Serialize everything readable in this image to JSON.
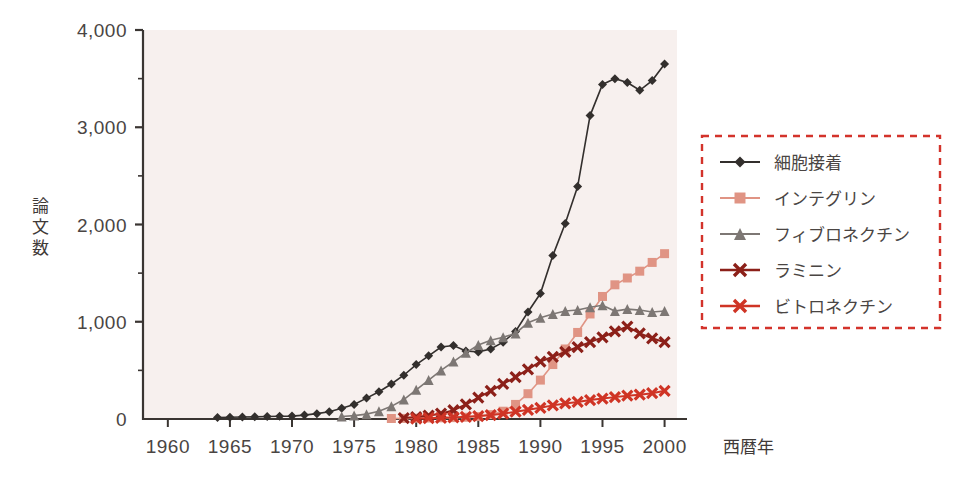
{
  "figure": {
    "background_color": "#ffffff",
    "plot_background_color": "#f7f0ee",
    "axis_color": "#3a3532"
  },
  "chart_data": {
    "type": "line",
    "title": "",
    "subtitle": "",
    "xlabel": "西暦年",
    "ylabel": "論文数",
    "xlim": [
      1958,
      2001
    ],
    "ylim": [
      0,
      4000
    ],
    "grid": false,
    "legend_position": "right",
    "legend_border_color": "#d3332b",
    "legend_border_style": "dashed",
    "x_ticks": [
      1960,
      1965,
      1970,
      1975,
      1980,
      1985,
      1990,
      1995,
      2000
    ],
    "x_tick_labels": [
      "1960",
      "1965",
      "1970",
      "1975",
      "1980",
      "1985",
      "1990",
      "1995",
      "2000"
    ],
    "y_ticks": [
      0,
      1000,
      2000,
      3000,
      4000
    ],
    "y_tick_labels": [
      "0",
      "1,000",
      "2,000",
      "3,000",
      "4,000"
    ],
    "y_minor_ticks": [
      500,
      1500,
      2500,
      3500
    ],
    "series": [
      {
        "name": "細胞接着",
        "color": "#332f2d",
        "marker": "diamond",
        "marker_size": 9,
        "line_width": 1.6,
        "x": [
          1964,
          1965,
          1966,
          1967,
          1968,
          1969,
          1970,
          1971,
          1972,
          1973,
          1974,
          1975,
          1976,
          1977,
          1978,
          1979,
          1980,
          1981,
          1982,
          1983,
          1984,
          1985,
          1986,
          1987,
          1988,
          1989,
          1990,
          1991,
          1992,
          1993,
          1994,
          1995,
          1996,
          1997,
          1998,
          1999,
          2000
        ],
        "values": [
          15,
          18,
          20,
          22,
          25,
          28,
          30,
          40,
          55,
          75,
          110,
          150,
          215,
          280,
          360,
          450,
          560,
          650,
          740,
          755,
          700,
          690,
          720,
          790,
          900,
          1100,
          1290,
          1680,
          2010,
          2390,
          3120,
          3440,
          3500,
          3460,
          3380,
          3480,
          3650
        ]
      },
      {
        "name": "インテグリン",
        "color": "#e09484",
        "marker": "square",
        "marker_size": 9,
        "line_width": 1.6,
        "x": [
          1978,
          1979,
          1980,
          1981,
          1982,
          1983,
          1984,
          1985,
          1986,
          1987,
          1988,
          1989,
          1990,
          1991,
          1992,
          1993,
          1994,
          1995,
          1996,
          1997,
          1998,
          1999,
          2000
        ],
        "values": [
          5,
          6,
          8,
          10,
          12,
          14,
          18,
          25,
          45,
          80,
          150,
          260,
          400,
          560,
          720,
          890,
          1080,
          1260,
          1380,
          1450,
          1520,
          1610,
          1700
        ]
      },
      {
        "name": "フィブロネクチン",
        "color": "#7d7774",
        "marker": "triangle",
        "marker_size": 10,
        "line_width": 1.6,
        "x": [
          1974,
          1975,
          1976,
          1977,
          1978,
          1979,
          1980,
          1981,
          1982,
          1983,
          1984,
          1985,
          1986,
          1987,
          1988,
          1989,
          1990,
          1991,
          1992,
          1993,
          1994,
          1995,
          1996,
          1997,
          1998,
          1999,
          2000
        ],
        "values": [
          25,
          35,
          50,
          80,
          130,
          200,
          300,
          400,
          500,
          590,
          680,
          760,
          810,
          840,
          880,
          990,
          1040,
          1080,
          1110,
          1120,
          1150,
          1170,
          1110,
          1130,
          1120,
          1100,
          1110
        ]
      },
      {
        "name": "ラミニン",
        "color": "#8c2019",
        "marker": "x",
        "marker_size": 10,
        "line_width": 2,
        "x": [
          1979,
          1980,
          1981,
          1982,
          1983,
          1984,
          1985,
          1986,
          1987,
          1988,
          1989,
          1990,
          1991,
          1992,
          1993,
          1994,
          1995,
          1996,
          1997,
          1998,
          1999,
          2000
        ],
        "values": [
          10,
          20,
          35,
          55,
          90,
          150,
          220,
          290,
          360,
          430,
          510,
          590,
          640,
          690,
          740,
          790,
          840,
          900,
          950,
          880,
          830,
          790
        ]
      },
      {
        "name": "ビトロネクチン",
        "color": "#cf3425",
        "marker": "x",
        "marker_size": 10,
        "line_width": 2,
        "x": [
          1980,
          1981,
          1982,
          1983,
          1984,
          1985,
          1986,
          1987,
          1988,
          1989,
          1990,
          1991,
          1992,
          1993,
          1994,
          1995,
          1996,
          1997,
          1998,
          1999,
          2000
        ],
        "values": [
          5,
          8,
          12,
          16,
          22,
          30,
          40,
          55,
          75,
          95,
          115,
          140,
          160,
          175,
          195,
          210,
          225,
          240,
          250,
          265,
          290
        ]
      }
    ]
  },
  "ylabel_chars": [
    "論",
    "文",
    "数"
  ]
}
